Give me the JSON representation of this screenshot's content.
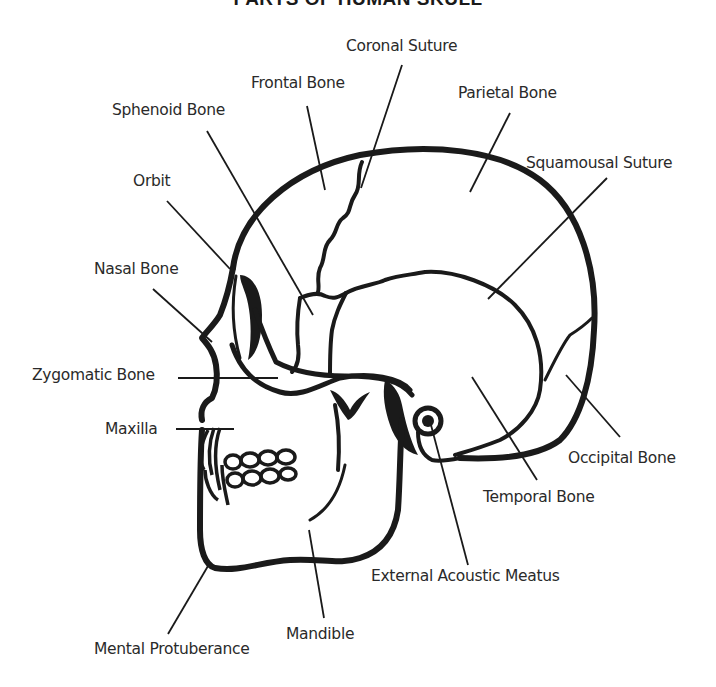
{
  "title": "PARTS OF HUMAN SKULL",
  "colors": {
    "ink": "#1a1a1a",
    "background": "#ffffff",
    "label_text": "#2a2a2a"
  },
  "labels": {
    "coronal_suture": "Coronal Suture",
    "frontal_bone": "Frontal Bone",
    "parietal_bone": "Parietal Bone",
    "sphenoid_bone": "Sphenoid Bone",
    "squamousal_suture": "Squamousal Suture",
    "orbit": "Orbit",
    "nasal_bone": "Nasal Bone",
    "zygomatic_bone": "Zygomatic Bone",
    "maxilla": "Maxilla",
    "occipital_bone": "Occipital Bone",
    "temporal_bone": "Temporal Bone",
    "external_acoustic_meatus": "External Acoustic Meatus",
    "mandible": "Mandible",
    "mental_protuberance": "Mental Protuberance"
  }
}
